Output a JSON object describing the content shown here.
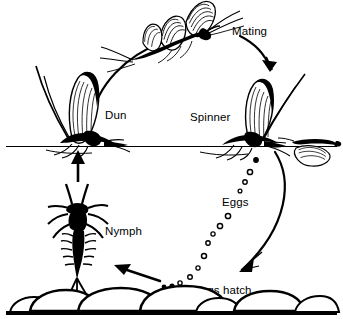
{
  "diagram": {
    "style": "black and white line drawing",
    "colors": {
      "ink": "#000000",
      "background": "#ffffff",
      "stone_fill": "#ffffff"
    },
    "labels": {
      "mating": "Mating",
      "dun": "Dun",
      "spinner": "Spinner",
      "eggs": "Eggs",
      "nymph": "Nymph",
      "eggs_hatch": "Eggs hatch"
    },
    "stages": [
      {
        "name": "dun",
        "label": "Dun",
        "x": 125,
        "y": 115
      },
      {
        "name": "mating",
        "label": "Mating",
        "x": 232,
        "y": 31
      },
      {
        "name": "spinner",
        "label": "Spinner",
        "x": 192,
        "y": 117
      },
      {
        "name": "eggs",
        "label": "Eggs",
        "x": 222,
        "y": 202
      },
      {
        "name": "eggs-hatch",
        "label": "Eggs hatch",
        "x": 193,
        "y": 290
      },
      {
        "name": "nymph",
        "label": "Nymph",
        "x": 105,
        "y": 231
      }
    ],
    "figures": {
      "mating_pair": "two adult mayflies joined in flight with spread striped wings and long trailing tails",
      "dun_adult": "upright winged mayfly resting on the water surface",
      "spinner_adult": "upright winged mayfly resting on the water surface",
      "spent_adult": "spent mayfly lying flat on the water surface at right",
      "nymph_larva": "aquatic nymph with segmented gilled abdomen, six legs, antennae and three tails",
      "riverbed": "row of rounded stones along the bottom"
    },
    "water_line_y": 146,
    "egg_count": 14,
    "stone_count": 7
  }
}
